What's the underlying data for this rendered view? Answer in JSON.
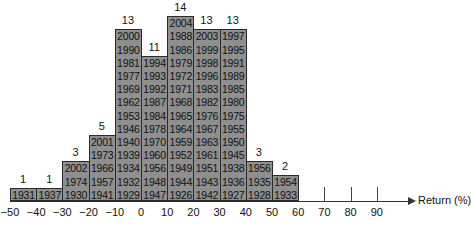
{
  "chart_data": {
    "type": "bar",
    "subtype": "histogram-stacked-labels",
    "title": "",
    "xlabel": "Return (%)",
    "ylabel": "",
    "x_ticks": [
      -50,
      -40,
      -30,
      -20,
      -10,
      0,
      10,
      20,
      30,
      40,
      50,
      60,
      70,
      80,
      90
    ],
    "x_tick_labels": [
      "-50",
      "-40",
      "-30",
      "-20",
      "-10",
      "0",
      "10",
      "20",
      "30",
      "40",
      "50",
      "60",
      "70",
      "80",
      "90"
    ],
    "bar_color": "#8f8f8f",
    "grid": false,
    "bins": [
      {
        "range": [
          -50,
          -40
        ],
        "count": 1,
        "years": [
          "1931"
        ]
      },
      {
        "range": [
          -40,
          -30
        ],
        "count": 1,
        "years": [
          "1937"
        ]
      },
      {
        "range": [
          -30,
          -20
        ],
        "count": 3,
        "years": [
          "2002",
          "1974",
          "1930"
        ]
      },
      {
        "range": [
          -20,
          -10
        ],
        "count": 5,
        "years": [
          "2001",
          "1973",
          "1966",
          "1957",
          "1941"
        ]
      },
      {
        "range": [
          -10,
          0
        ],
        "count": 13,
        "years": [
          "2000",
          "1990",
          "1981",
          "1977",
          "1969",
          "1962",
          "1953",
          "1946",
          "1940",
          "1939",
          "1934",
          "1932",
          "1929"
        ]
      },
      {
        "range": [
          0,
          10
        ],
        "count": 11,
        "years": [
          "1994",
          "1993",
          "1992",
          "1987",
          "1984",
          "1978",
          "1970",
          "1960",
          "1956",
          "1948",
          "1947"
        ]
      },
      {
        "range": [
          10,
          20
        ],
        "count": 14,
        "years": [
          "2004",
          "1988",
          "1986",
          "1979",
          "1972",
          "1971",
          "1968",
          "1965",
          "1964",
          "1959",
          "1952",
          "1949",
          "1944",
          "1926"
        ]
      },
      {
        "range": [
          20,
          30
        ],
        "count": 13,
        "years": [
          "2003",
          "1999",
          "1998",
          "1996",
          "1983",
          "1982",
          "1976",
          "1967",
          "1963",
          "1961",
          "1951",
          "1943",
          "1942"
        ]
      },
      {
        "range": [
          30,
          40
        ],
        "count": 13,
        "years": [
          "1997",
          "1995",
          "1991",
          "1989",
          "1985",
          "1980",
          "1975",
          "1955",
          "1950",
          "1945",
          "1938",
          "1936",
          "1927"
        ]
      },
      {
        "range": [
          40,
          50
        ],
        "count": 3,
        "years": [
          "1956",
          "1935",
          "1928"
        ]
      },
      {
        "range": [
          50,
          60
        ],
        "count": 2,
        "years": [
          "1954",
          "1933"
        ]
      },
      {
        "range": [
          60,
          70
        ],
        "count": 0,
        "years": []
      },
      {
        "range": [
          70,
          80
        ],
        "count": 0,
        "years": []
      },
      {
        "range": [
          80,
          90
        ],
        "count": 0,
        "years": []
      }
    ],
    "categories": [
      "-50 to -40",
      "-40 to -30",
      "-30 to -20",
      "-20 to -10",
      "-10 to 0",
      "0 to 10",
      "10 to 20",
      "20 to 30",
      "30 to 40",
      "40 to 50",
      "50 to 60",
      "60 to 70",
      "70 to 80",
      "80 to 90"
    ],
    "values": [
      1,
      1,
      3,
      5,
      13,
      11,
      14,
      13,
      13,
      3,
      2,
      0,
      0,
      0
    ]
  }
}
